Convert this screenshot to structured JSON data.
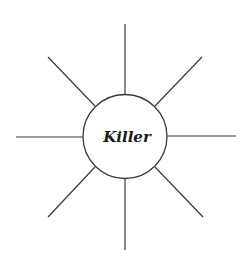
{
  "diagram": {
    "type": "spider-map",
    "center": {
      "label": "Killer",
      "cx": 125,
      "cy": 136.5,
      "r": 42
    },
    "rays": [
      {
        "name": "ray-top",
        "x1": 125,
        "y1": 94.5,
        "x2": 125,
        "y2": 24
      },
      {
        "name": "ray-top-right",
        "x1": 155,
        "y1": 106,
        "x2": 202,
        "y2": 57
      },
      {
        "name": "ray-right",
        "x1": 167,
        "y1": 136,
        "x2": 236,
        "y2": 136
      },
      {
        "name": "ray-bottom-right",
        "x1": 155,
        "y1": 167,
        "x2": 203,
        "y2": 217
      },
      {
        "name": "ray-bottom",
        "x1": 125,
        "y1": 178.5,
        "x2": 125,
        "y2": 250
      },
      {
        "name": "ray-bottom-left",
        "x1": 95,
        "y1": 167,
        "x2": 48,
        "y2": 217
      },
      {
        "name": "ray-left",
        "x1": 83,
        "y1": 137,
        "x2": 16,
        "y2": 137
      },
      {
        "name": "ray-top-left",
        "x1": 95,
        "y1": 106,
        "x2": 48,
        "y2": 57
      }
    ],
    "colors": {
      "stroke": "#3a3a3a",
      "text": "#1a1a1a",
      "background": "#ffffff"
    }
  }
}
